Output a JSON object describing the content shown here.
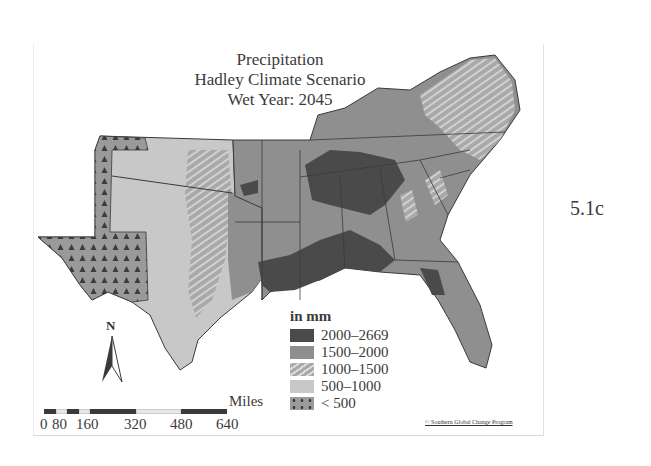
{
  "map": {
    "title_lines": [
      "Precipitation",
      "Hadley Climate Scenario",
      "Wet Year: 2045"
    ],
    "figure_label": "5.1c",
    "legend": {
      "title": "in mm",
      "items": [
        {
          "label": "2000–2669",
          "color": "#4a4a4a",
          "pattern": "solid"
        },
        {
          "label": "1500–2000",
          "color": "#8f8f8f",
          "pattern": "solid"
        },
        {
          "label": "1000–1500",
          "color": "#a9a9a9",
          "pattern": "hatch"
        },
        {
          "label": "500–1000",
          "color": "#c8c8c8",
          "pattern": "solid"
        },
        {
          "label": "< 500",
          "color": "#9a9a9a",
          "pattern": "triangles"
        }
      ]
    },
    "north_arrow": {
      "label": "N"
    },
    "scale_bar": {
      "unit": "Miles",
      "ticks": [
        "0",
        "80",
        "160",
        "320",
        "480",
        "640"
      ]
    },
    "credit": "© Southern Global Change Program",
    "colors": {
      "wettest": "#4a4a4a",
      "wet": "#8f8f8f",
      "moderate": "#a9a9a9",
      "dry": "#c8c8c8",
      "driest": "#9a9a9a",
      "border": "#3a3a3a"
    }
  }
}
